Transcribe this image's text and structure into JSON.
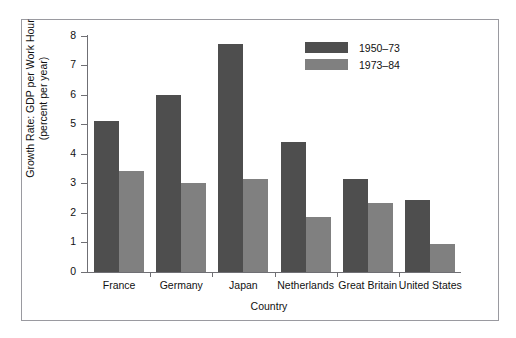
{
  "chart_data": {
    "type": "bar",
    "title": "",
    "subtitle": "",
    "xlabel": "Country",
    "ylabel": "Growth Rate: GDP per Work Hour\n(percent per year)",
    "categories": [
      "France",
      "Germany",
      "Japan",
      "Netherlands",
      "Great Britain",
      "United States"
    ],
    "series": [
      {
        "name": "1950–73",
        "color": "#4e4e4e",
        "values": [
          5.1,
          6.0,
          7.7,
          4.4,
          3.15,
          2.45
        ]
      },
      {
        "name": "1973–84",
        "color": "#808080",
        "values": [
          3.4,
          3.0,
          3.15,
          1.85,
          2.35,
          0.95
        ]
      }
    ],
    "ylim": [
      0,
      8
    ],
    "yticks": [
      0,
      1,
      2,
      3,
      4,
      5,
      6,
      7,
      8
    ],
    "ytick_labels": [
      "0",
      "1",
      "2",
      "3",
      "4",
      "5",
      "6",
      "7",
      "8"
    ],
    "grid": false,
    "legend_position": "upper right"
  },
  "figure": {
    "frame_color": "#9a9aa0",
    "axis_color": "#6f6f74",
    "background": "#ffffff"
  }
}
